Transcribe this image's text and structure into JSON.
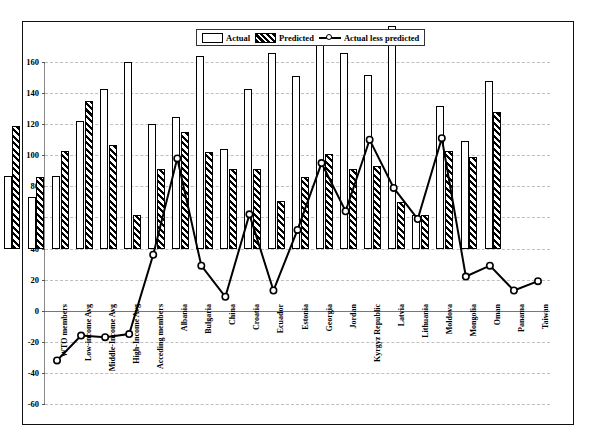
{
  "chart_data": {
    "type": "bar",
    "title": "",
    "xlabel": "",
    "ylabel": "",
    "ylim": [
      -60,
      160
    ],
    "ytick_step": 20,
    "yticks": [
      160,
      140,
      120,
      100,
      80,
      60,
      40,
      20,
      0,
      -20,
      -40,
      -60
    ],
    "grid": true,
    "legend_position": "top-center",
    "categories": [
      "WTO members",
      "Low-income Avg",
      "Middle-Income Avg",
      "High-Income Avg",
      "Acceding members",
      "Albania",
      "Bulgaria",
      "China",
      "Croatia",
      "Ecuador",
      "Estonia",
      "Georgia",
      "Jordan",
      "Kyrgyz Republic",
      "Latvia",
      "Lithuania",
      "Moldova",
      "Mongolia",
      "Oman",
      "Panama",
      "Taiwan"
    ],
    "series": [
      {
        "name": "Actual",
        "type": "bar",
        "style": "hollow",
        "values": [
          47,
          33,
          47,
          82,
          103,
          120,
          80,
          85,
          124,
          64,
          103,
          126,
          111,
          138,
          126,
          112,
          143,
          22,
          92,
          69,
          108
        ]
      },
      {
        "name": "Predicted",
        "type": "bar",
        "style": "hatched",
        "values": [
          79,
          46,
          63,
          95,
          67,
          22,
          51,
          75,
          62,
          51,
          51,
          31,
          46,
          61,
          51,
          53,
          30,
          22,
          63,
          59,
          88
        ]
      },
      {
        "name": "Actual less predicted",
        "type": "line",
        "marker": "circle",
        "values": [
          -32,
          -16,
          -17,
          -15,
          36,
          98,
          29,
          9,
          62,
          13,
          52,
          95,
          64,
          110,
          79,
          59,
          111,
          22,
          29,
          13,
          19
        ]
      }
    ]
  },
  "legend": {
    "items": [
      {
        "label": "Actual",
        "swatch": "hollow-rect-icon"
      },
      {
        "label": "Predicted",
        "swatch": "hatched-rect-icon"
      },
      {
        "label": "Actual less predicted",
        "swatch": "line-marker-icon"
      }
    ]
  }
}
